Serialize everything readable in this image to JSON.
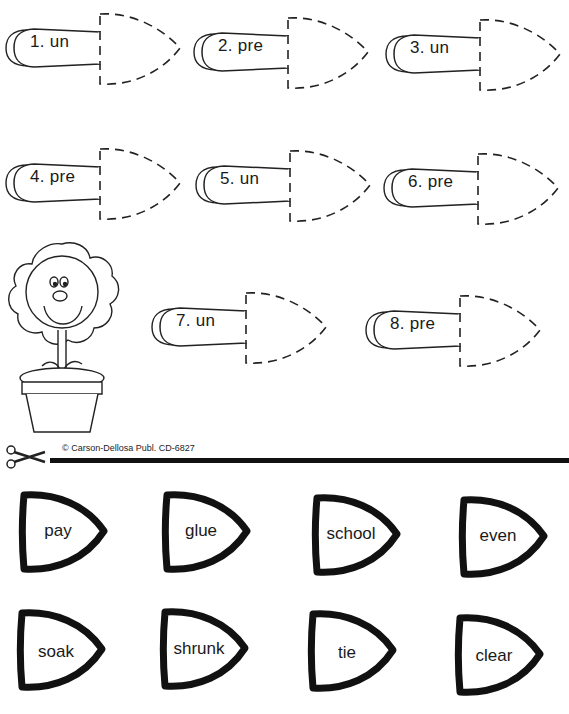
{
  "worksheet": {
    "slots": [
      {
        "number": "1.",
        "prefix": "un",
        "label": "1.  un"
      },
      {
        "number": "2.",
        "prefix": "pre",
        "label": "2.  pre"
      },
      {
        "number": "3.",
        "prefix": "un",
        "label": "3.  un"
      },
      {
        "number": "4.",
        "prefix": "pre",
        "label": "4.  pre"
      },
      {
        "number": "5.",
        "prefix": "un",
        "label": "5.  un"
      },
      {
        "number": "6.",
        "prefix": "pre",
        "label": "6.  pre"
      },
      {
        "number": "7.",
        "prefix": "un",
        "label": "7.  un"
      },
      {
        "number": "8.",
        "prefix": "pre",
        "label": "8.  pre"
      }
    ],
    "copyright": "© Carson-Dellosa Publ.  CD-6827",
    "cut_pieces": [
      {
        "word": "pay"
      },
      {
        "word": "glue"
      },
      {
        "word": "school"
      },
      {
        "word": "even"
      },
      {
        "word": "soak"
      },
      {
        "word": "shrunk"
      },
      {
        "word": "tie"
      },
      {
        "word": "clear"
      }
    ],
    "icons": {
      "scissors": "scissors-icon",
      "flower": "flower-pot-illustration"
    }
  }
}
